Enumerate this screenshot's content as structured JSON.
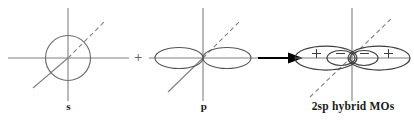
{
  "diagram": {
    "type": "orbital-hybridization-schematic",
    "background_color": "#ffffff",
    "axis_color": "#808080",
    "orbital_outline_color": "#4d4d4d",
    "arrow_color": "#000000",
    "label_color": "#1a1a1a",
    "equation_text": "s + p → 2sp hybrid MOs"
  },
  "terms": [
    {
      "id": "s-orbital",
      "label": "s",
      "shape": "circle",
      "axes": [
        "vertical",
        "horizontal",
        "diagonal"
      ],
      "diagonal_style": "solid lower-left, dashed upper-right",
      "signs": []
    },
    {
      "id": "p-orbital",
      "label": "p",
      "shape": "two-horizontal-lobes",
      "axes": [
        "vertical",
        "horizontal",
        "diagonal"
      ],
      "diagonal_style": "solid lower-left, dashed upper-right",
      "signs": []
    },
    {
      "id": "sp-hybrid-orbital",
      "label": "2sp hybrid MOs",
      "shape": "two-large-outer-lobes-with-small-inner-lobes",
      "axes": [
        "vertical",
        "horizontal",
        "diagonal"
      ],
      "diagonal_style": "dashed full length",
      "signs": [
        "+",
        "−",
        "−",
        "+"
      ]
    }
  ],
  "operators": {
    "plus": "+",
    "arrow": "→"
  },
  "sign_labels": {
    "positive": "+",
    "negative": "−"
  }
}
